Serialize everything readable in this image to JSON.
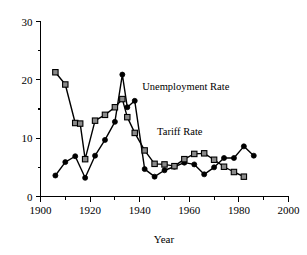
{
  "chart_data": {
    "type": "line",
    "title": "",
    "xlabel": "Year",
    "ylabel": "",
    "xlim": [
      1900,
      2000
    ],
    "ylim": [
      0,
      30
    ],
    "grid": false,
    "legend_position": "inline-annotation",
    "x_ticks_major": [
      "1900",
      "1920",
      "1940",
      "1960",
      "1980",
      "2000"
    ],
    "x_ticks_major_values": [
      1900,
      1920,
      1940,
      1960,
      1980,
      2000
    ],
    "x_ticks_minor_values": [
      1910,
      1930,
      1950,
      1970,
      1990
    ],
    "y_ticks_major": [
      "0",
      "10",
      "20",
      "30"
    ],
    "y_ticks_major_values": [
      0,
      10,
      20,
      30
    ],
    "y_ticks_minor_values": [
      5,
      15,
      25
    ],
    "series": [
      {
        "name": "Unemployment Rate",
        "marker": "filled-circle",
        "annotation": "Unemployment Rate",
        "x": [
          1906,
          1910,
          1914,
          1918,
          1922,
          1926,
          1930,
          1933,
          1935,
          1938,
          1942,
          1946,
          1950,
          1954,
          1958,
          1962,
          1966,
          1970,
          1974,
          1978,
          1982,
          1986
        ],
        "values": [
          3.6,
          5.9,
          6.9,
          3.2,
          7.0,
          9.7,
          12.8,
          20.9,
          15.3,
          16.4,
          4.7,
          3.4,
          4.5,
          5.1,
          5.8,
          5.5,
          3.8,
          5.0,
          6.6,
          6.6,
          8.6,
          7.0
        ]
      },
      {
        "name": "Tariff Rate",
        "marker": "open-square",
        "annotation": "Tariff Rate",
        "x": [
          1906,
          1910,
          1914,
          1916,
          1918,
          1922,
          1926,
          1930,
          1933,
          1935,
          1938,
          1942,
          1946,
          1950,
          1954,
          1958,
          1962,
          1966,
          1970,
          1974,
          1978,
          1982
        ],
        "values": [
          21.3,
          19.2,
          12.6,
          12.5,
          6.4,
          13.0,
          14.0,
          15.3,
          16.7,
          13.6,
          10.9,
          7.9,
          5.6,
          5.5,
          5.2,
          6.4,
          7.3,
          7.4,
          6.3,
          5.1,
          4.2,
          3.4
        ]
      }
    ],
    "annotations": [
      {
        "text": "Unemployment Rate",
        "x": 1941,
        "y": 18.2
      },
      {
        "text": "Tariff Rate",
        "x": 1947,
        "y": 10.6
      }
    ]
  },
  "axis": {
    "x_title": "Year"
  }
}
